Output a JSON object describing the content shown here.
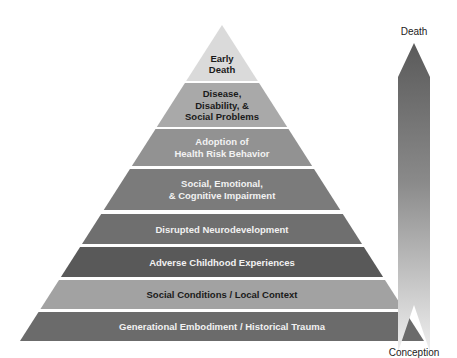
{
  "pyramid": {
    "levels": [
      {
        "lines": [
          "Early",
          "Death"
        ],
        "fill": "#dadada",
        "text_color": "#1a1a1a"
      },
      {
        "lines": [
          "Disease,",
          "Disability, &",
          "Social Problems"
        ],
        "fill": "#a9a9a9",
        "text_color": "#1a1a1a"
      },
      {
        "lines": [
          "Adoption of",
          "Health Risk Behavior"
        ],
        "fill": "#929292",
        "text_color": "#f2f2f2"
      },
      {
        "lines": [
          "Social, Emotional,",
          "& Cognitive Impairment"
        ],
        "fill": "#7b7b7b",
        "text_color": "#f2f2f2"
      },
      {
        "lines": [
          "Disrupted Neurodevelopment"
        ],
        "fill": "#6f6f6f",
        "text_color": "#f2f2f2"
      },
      {
        "lines": [
          "Adverse Childhood Experiences"
        ],
        "fill": "#595959",
        "text_color": "#f2f2f2"
      },
      {
        "lines": [
          "Social Conditions / Local Context"
        ],
        "fill": "#a2a2a2",
        "text_color": "#1a1a1a"
      },
      {
        "lines": [
          "Generational Embodiment / Historical Trauma"
        ],
        "fill": "#6b6b6b",
        "text_color": "#f2f2f2"
      }
    ]
  },
  "timeline_arrow": {
    "top_label": "Death",
    "bottom_label": "Conception",
    "top_color": "#5a5a5a",
    "bottom_color": "#f0f0f0"
  }
}
